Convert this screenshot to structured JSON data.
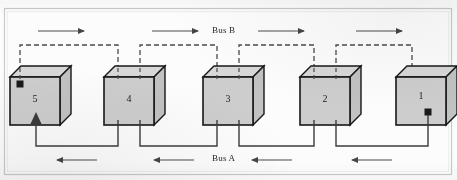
{
  "figure": {
    "type": "block-diagram",
    "background_color": "#fcfcfc",
    "frame_color": "#c9c9c9"
  },
  "buses": {
    "bus_b": {
      "label": "Bus B",
      "label_x": 228,
      "label_y": 31,
      "line_style": "dashed",
      "color": "#4a4a4a",
      "direction": "right",
      "position": "top",
      "arrow_count": 4,
      "arrows": [
        {
          "x1": 38,
          "x2": 86,
          "y": 31
        },
        {
          "x1": 152,
          "x2": 200,
          "y": 31
        },
        {
          "x1": 258,
          "x2": 306,
          "y": 31
        },
        {
          "x1": 356,
          "x2": 404,
          "y": 31
        }
      ]
    },
    "bus_a": {
      "label": "Bus A",
      "label_x": 228,
      "label_y": 158,
      "line_style": "solid",
      "color": "#3c3c3c",
      "direction": "left",
      "position": "bottom",
      "arrow_count": 4,
      "arrows": [
        {
          "x1": 95,
          "x2": 55,
          "y": 160
        },
        {
          "x1": 192,
          "x2": 152,
          "y": 160
        },
        {
          "x1": 290,
          "x2": 250,
          "y": 160
        },
        {
          "x1": 390,
          "x2": 350,
          "y": 160
        }
      ]
    }
  },
  "nodes": [
    {
      "label": "5",
      "x": 10,
      "y": 77,
      "w": 50,
      "h": 48,
      "depth": 11,
      "fill": "#cdcdcd",
      "stroke": "#171717",
      "has_in_port_marker": true,
      "has_out_port_marker": false,
      "bus_b_taps": 1,
      "bus_a_taps": 1,
      "bus_b_arrow_in": false,
      "bus_a_arrow_in": true
    },
    {
      "label": "4",
      "x": 104,
      "y": 77,
      "w": 50,
      "h": 48,
      "depth": 11,
      "fill": "#cdcdcd",
      "stroke": "#171717",
      "has_in_port_marker": false,
      "has_out_port_marker": false,
      "bus_b_taps": 2,
      "bus_a_taps": 2,
      "bus_b_arrow_in": false,
      "bus_a_arrow_in": false
    },
    {
      "label": "3",
      "x": 203,
      "y": 77,
      "w": 50,
      "h": 48,
      "depth": 11,
      "fill": "#cdcdcd",
      "stroke": "#171717",
      "has_in_port_marker": false,
      "has_out_port_marker": false,
      "bus_b_taps": 2,
      "bus_a_taps": 2,
      "bus_b_arrow_in": false,
      "bus_a_arrow_in": false
    },
    {
      "label": "2",
      "x": 300,
      "y": 77,
      "w": 50,
      "h": 48,
      "depth": 11,
      "fill": "#cdcdcd",
      "stroke": "#171717",
      "has_in_port_marker": false,
      "has_out_port_marker": false,
      "bus_b_taps": 2,
      "bus_a_taps": 2,
      "bus_b_arrow_in": false,
      "bus_a_arrow_in": false
    },
    {
      "label": "1",
      "x": 396,
      "y": 77,
      "w": 50,
      "h": 48,
      "depth": 11,
      "fill": "#cdcdcd",
      "stroke": "#171717",
      "has_in_port_marker": false,
      "has_out_port_marker": true,
      "bus_b_taps": 1,
      "bus_a_taps": 1,
      "bus_b_arrow_in": true,
      "bus_a_arrow_in": false
    }
  ],
  "style": {
    "dash_pattern": "5,3",
    "bus_b_rail_y": 45,
    "bus_a_rail_y": 146,
    "line_width": 1.3,
    "marker_size": 6,
    "marker_color": "#1a1a1a"
  }
}
